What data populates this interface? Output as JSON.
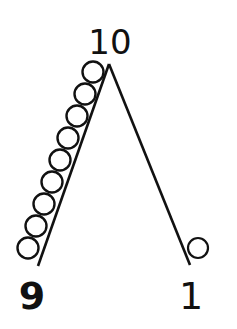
{
  "diagram": {
    "labels": {
      "top": "10",
      "left": "9",
      "right": "1"
    },
    "left_side_ball_count": 9,
    "right_side_ball_count": 1,
    "colors": {
      "stroke": "#111111",
      "background": "#ffffff"
    }
  }
}
